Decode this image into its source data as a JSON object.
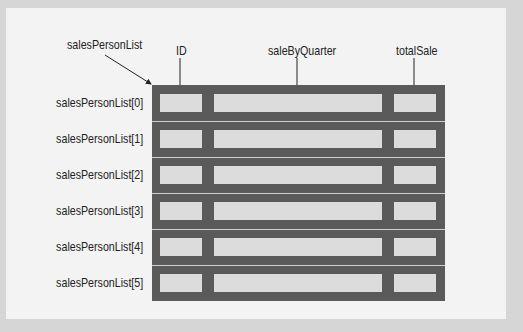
{
  "diagram": {
    "array_label": "salesPersonList",
    "field_labels": [
      {
        "key": "id",
        "label": "ID"
      },
      {
        "key": "sale_by_quarter",
        "label": "saleByQuarter"
      },
      {
        "key": "total_sale",
        "label": "totalSale"
      }
    ],
    "rows": [
      {
        "label": "salesPersonList[0]"
      },
      {
        "label": "salesPersonList[1]"
      },
      {
        "label": "salesPersonList[2]"
      },
      {
        "label": "salesPersonList[3]"
      },
      {
        "label": "salesPersonList[4]"
      },
      {
        "label": "salesPersonList[5]"
      }
    ],
    "colors": {
      "background": "#d6d6d6",
      "panel": "#f3f3f3",
      "grid": "#5a5a5a",
      "cell": "#dcdcdc"
    }
  }
}
